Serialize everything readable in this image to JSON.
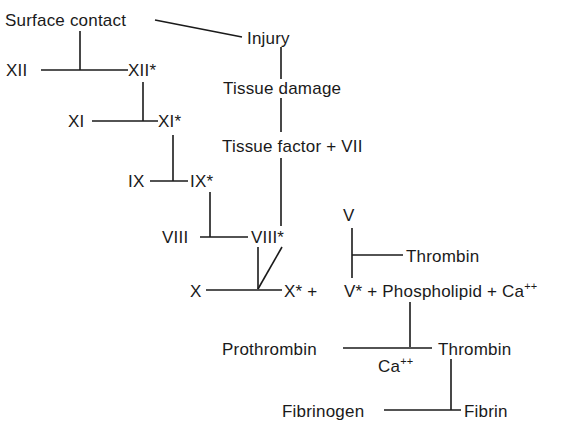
{
  "nodes": {
    "surface_contact": "Surface contact",
    "injury": "Injury",
    "xii": "XII",
    "xii_active": "XII*",
    "tissue_damage": "Tissue damage",
    "xi": "XI",
    "xi_active": "XI*",
    "tissue_factor_vii": "Tissue factor + VII",
    "ix": "IX",
    "ix_active": "IX*",
    "v": "V",
    "viii": "VIII",
    "viii_active": "VIII*",
    "thrombin_feedback": "Thrombin",
    "x": "X",
    "x_active_plus": "X* +",
    "v_complex": "V* + Phospholipid + Ca",
    "v_complex_sup": "++",
    "prothrombin": "Prothrombin",
    "ca_label": "Ca",
    "ca_sup": "++",
    "thrombin": "Thrombin",
    "fibrinogen": "Fibrinogen",
    "fibrin": "Fibrin"
  },
  "colors": {
    "ink": "#1a1a1a",
    "background": "#ffffff"
  }
}
